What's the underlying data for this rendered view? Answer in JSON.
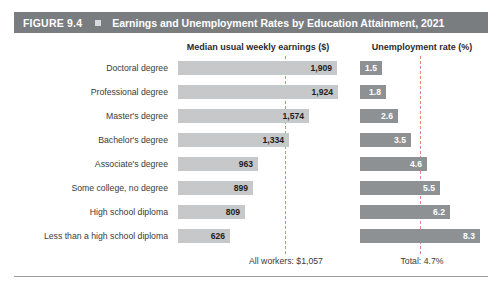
{
  "figure": {
    "number_label": "FIGURE 9.4",
    "marker_icon": "square-bullet-icon",
    "title": "Earnings and Unemployment Rates by Education Attainment, 2021"
  },
  "columns": {
    "earnings_header": "Median usual weekly earnings ($)",
    "unemployment_header": "Unemployment rate (%)"
  },
  "footnotes": {
    "earnings_total": "All workers: $1,057",
    "unemployment_total": "Total: 4.7%"
  },
  "colors": {
    "header_bar": "#7a7d80",
    "earnings_bar": "#c6c8ca",
    "unemployment_bar": "#8e9194",
    "reference_line": "#e0877f",
    "background": "#ffffff"
  },
  "chart_data": {
    "type": "bar",
    "title": "Earnings and Unemployment Rates by Education Attainment, 2021",
    "orientation": "horizontal",
    "grid": false,
    "legend": "none",
    "categories": [
      "Doctoral degree",
      "Professional degree",
      "Master's degree",
      "Bachelor's degree",
      "Associate's degree",
      "Some college, no degree",
      "High school diploma",
      "Less than a high school diploma"
    ],
    "series": [
      {
        "name": "Median usual weekly earnings ($)",
        "xlabel": "Median usual weekly earnings ($)",
        "values": [
          1909,
          1924,
          1574,
          1334,
          963,
          899,
          809,
          626
        ],
        "labels": [
          "1,909",
          "1,924",
          "1,574",
          "1,334",
          "963",
          "899",
          "809",
          "626"
        ],
        "xlim": [
          0,
          1924
        ],
        "reference_line": {
          "value": 1057,
          "label": "All workers: $1,057"
        }
      },
      {
        "name": "Unemployment rate (%)",
        "xlabel": "Unemployment rate (%)",
        "values": [
          1.5,
          1.8,
          2.6,
          3.5,
          4.6,
          5.5,
          6.2,
          8.3
        ],
        "labels": [
          "1.5",
          "1.8",
          "2.6",
          "3.5",
          "4.6",
          "5.5",
          "6.2",
          "8.3"
        ],
        "xlim": [
          0,
          8.3
        ],
        "reference_line": {
          "value": 4.7,
          "label": "Total: 4.7%"
        }
      }
    ]
  }
}
